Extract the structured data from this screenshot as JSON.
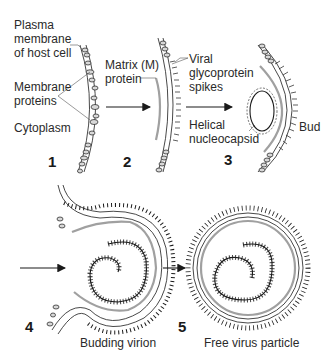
{
  "diagram": {
    "colors": {
      "line": "#1a1a1a",
      "matrix_protein": "#a0a0a0",
      "background": "#ffffff"
    },
    "steps": [
      {
        "number": "1",
        "caption": ""
      },
      {
        "number": "2",
        "caption": ""
      },
      {
        "number": "3",
        "caption": ""
      },
      {
        "number": "4",
        "caption": "Budding virion"
      },
      {
        "number": "5",
        "caption": "Free virus particle"
      }
    ],
    "labels": {
      "plasma_membrane": [
        "Plasma",
        "membrane",
        "of host cell"
      ],
      "membrane_proteins": [
        "Membrane",
        "proteins"
      ],
      "cytoplasm": "Cytoplasm",
      "matrix_protein": [
        "Matrix (M)",
        "protein"
      ],
      "glycoprotein_spikes": [
        "Viral",
        "glycoprotein",
        "spikes"
      ],
      "helical_nucleocapsid": [
        "Helical",
        "nucleocapsid"
      ],
      "bud": "Bud"
    }
  }
}
